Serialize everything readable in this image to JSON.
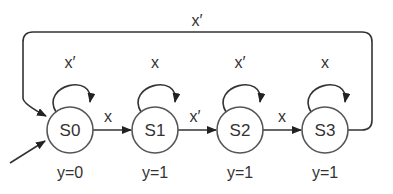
{
  "diagram": {
    "type": "state-machine",
    "states": [
      {
        "id": "S0",
        "label": "S0",
        "output": "y=0",
        "self_loop": "x′",
        "initial": true
      },
      {
        "id": "S1",
        "label": "S1",
        "output": "y=1",
        "self_loop": "x"
      },
      {
        "id": "S2",
        "label": "S2",
        "output": "y=1",
        "self_loop": "x′"
      },
      {
        "id": "S3",
        "label": "S3",
        "output": "y=1",
        "self_loop": "x"
      }
    ],
    "transitions": [
      {
        "from": "S0",
        "to": "S1",
        "label": "x"
      },
      {
        "from": "S1",
        "to": "S2",
        "label": "x′"
      },
      {
        "from": "S2",
        "to": "S3",
        "label": "x"
      },
      {
        "from": "S3",
        "to": "S0",
        "label": "x′"
      }
    ]
  }
}
